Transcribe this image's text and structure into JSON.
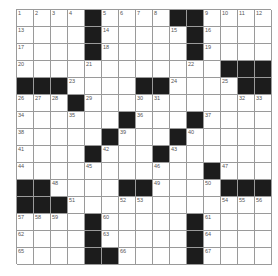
{
  "puzzle": {
    "rows": 15,
    "cols": 15,
    "colors": {
      "block": "#1c1c1c",
      "cell": "#ffffff",
      "line": "#9a9a9a"
    },
    "grid": [
      "....#....##....",
      "....#.....#....",
      "....#.....#....",
      "............###",
      "###....##....##",
      "...#...........",
      "......#...#....",
      ".....#...#.....",
      "....#...#......",
      "...........#...",
      "##....##....###",
      "###............",
      "....#.....#....",
      "....#.....#....",
      "....##....#...."
    ],
    "numbers": [
      {
        "r": 0,
        "c": 0,
        "n": "1"
      },
      {
        "r": 0,
        "c": 1,
        "n": "2"
      },
      {
        "r": 0,
        "c": 2,
        "n": "3"
      },
      {
        "r": 0,
        "c": 3,
        "n": "4"
      },
      {
        "r": 0,
        "c": 5,
        "n": "5"
      },
      {
        "r": 0,
        "c": 6,
        "n": "6"
      },
      {
        "r": 0,
        "c": 7,
        "n": "7"
      },
      {
        "r": 0,
        "c": 8,
        "n": "8"
      },
      {
        "r": 0,
        "c": 11,
        "n": "9"
      },
      {
        "r": 0,
        "c": 12,
        "n": "10"
      },
      {
        "r": 0,
        "c": 13,
        "n": "11"
      },
      {
        "r": 0,
        "c": 14,
        "n": "12"
      },
      {
        "r": 1,
        "c": 0,
        "n": "13"
      },
      {
        "r": 1,
        "c": 5,
        "n": "14"
      },
      {
        "r": 1,
        "c": 9,
        "n": "15"
      },
      {
        "r": 1,
        "c": 11,
        "n": "16"
      },
      {
        "r": 2,
        "c": 0,
        "n": "17"
      },
      {
        "r": 2,
        "c": 5,
        "n": "18"
      },
      {
        "r": 2,
        "c": 11,
        "n": "19"
      },
      {
        "r": 3,
        "c": 0,
        "n": "20"
      },
      {
        "r": 3,
        "c": 4,
        "n": "21"
      },
      {
        "r": 3,
        "c": 10,
        "n": "22"
      },
      {
        "r": 4,
        "c": 3,
        "n": "23"
      },
      {
        "r": 4,
        "c": 9,
        "n": "24"
      },
      {
        "r": 4,
        "c": 12,
        "n": "25"
      },
      {
        "r": 5,
        "c": 0,
        "n": "26"
      },
      {
        "r": 5,
        "c": 1,
        "n": "27"
      },
      {
        "r": 5,
        "c": 2,
        "n": "28"
      },
      {
        "r": 5,
        "c": 4,
        "n": "29"
      },
      {
        "r": 5,
        "c": 7,
        "n": "30"
      },
      {
        "r": 5,
        "c": 8,
        "n": "31"
      },
      {
        "r": 5,
        "c": 13,
        "n": "32"
      },
      {
        "r": 5,
        "c": 14,
        "n": "33"
      },
      {
        "r": 6,
        "c": 0,
        "n": "34"
      },
      {
        "r": 6,
        "c": 3,
        "n": "35"
      },
      {
        "r": 6,
        "c": 7,
        "n": "36"
      },
      {
        "r": 6,
        "c": 11,
        "n": "37"
      },
      {
        "r": 7,
        "c": 0,
        "n": "38"
      },
      {
        "r": 7,
        "c": 6,
        "n": "39"
      },
      {
        "r": 7,
        "c": 10,
        "n": "40"
      },
      {
        "r": 8,
        "c": 0,
        "n": "41"
      },
      {
        "r": 8,
        "c": 5,
        "n": "42"
      },
      {
        "r": 8,
        "c": 9,
        "n": "43"
      },
      {
        "r": 9,
        "c": 0,
        "n": "44"
      },
      {
        "r": 9,
        "c": 4,
        "n": "45"
      },
      {
        "r": 9,
        "c": 8,
        "n": "46"
      },
      {
        "r": 9,
        "c": 12,
        "n": "47"
      },
      {
        "r": 10,
        "c": 2,
        "n": "48"
      },
      {
        "r": 10,
        "c": 8,
        "n": "49"
      },
      {
        "r": 10,
        "c": 11,
        "n": "50"
      },
      {
        "r": 11,
        "c": 3,
        "n": "51"
      },
      {
        "r": 11,
        "c": 6,
        "n": "52"
      },
      {
        "r": 11,
        "c": 7,
        "n": "53"
      },
      {
        "r": 11,
        "c": 12,
        "n": "54"
      },
      {
        "r": 11,
        "c": 13,
        "n": "55"
      },
      {
        "r": 11,
        "c": 14,
        "n": "56"
      },
      {
        "r": 12,
        "c": 0,
        "n": "57"
      },
      {
        "r": 12,
        "c": 1,
        "n": "58"
      },
      {
        "r": 12,
        "c": 2,
        "n": "59"
      },
      {
        "r": 12,
        "c": 5,
        "n": "60"
      },
      {
        "r": 12,
        "c": 11,
        "n": "61"
      },
      {
        "r": 13,
        "c": 0,
        "n": "62"
      },
      {
        "r": 13,
        "c": 5,
        "n": "63"
      },
      {
        "r": 13,
        "c": 11,
        "n": "64"
      },
      {
        "r": 14,
        "c": 0,
        "n": "65"
      },
      {
        "r": 14,
        "c": 6,
        "n": "66"
      },
      {
        "r": 14,
        "c": 11,
        "n": "67"
      }
    ]
  }
}
